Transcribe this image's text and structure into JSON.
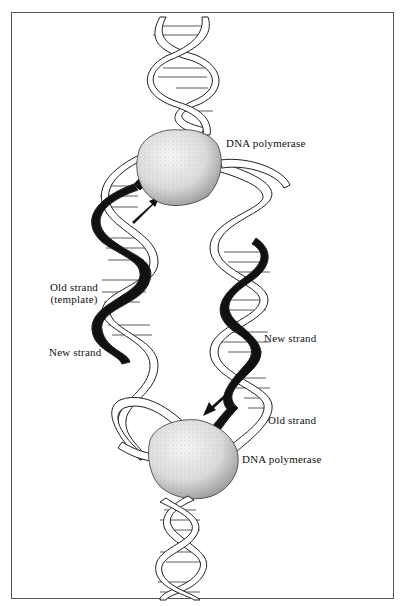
{
  "figure": {
    "labels": {
      "polymerase_top": "DNA polymerase",
      "old_strand_template_line1": "Old strand",
      "old_strand_template_line2": "(template)",
      "new_strand_left": "New strand",
      "new_strand_right": "New strand",
      "old_strand_right": "Old strand",
      "polymerase_bottom": "DNA polymerase"
    },
    "colors": {
      "outline": "#222222",
      "new_strand": "#111111",
      "ribbon_fill": "#ffffff",
      "polymerase_fill": "#e9e9e9",
      "frame_border": "#555555"
    }
  }
}
